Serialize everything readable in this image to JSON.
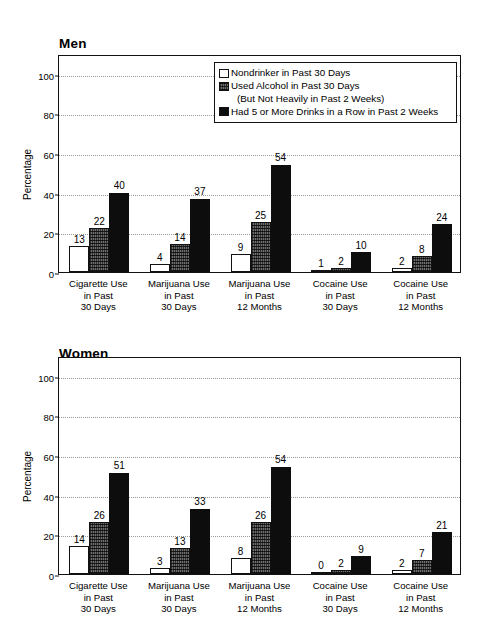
{
  "chart_data": [
    {
      "type": "bar",
      "title": "Men",
      "xlabel": "",
      "ylabel": "Percentage",
      "ylim": [
        0,
        110
      ],
      "yticks": [
        0,
        20,
        40,
        60,
        80,
        100
      ],
      "grid": true,
      "legend_position": "top-right",
      "categories": [
        "Cigarette Use\nin Past\n30 Days",
        "Marijuana Use\nin Past\n30 Days",
        "Marijuana Use\nin Past\n12 Months",
        "Cocaine Use\nin Past\n30 Days",
        "Cocaine Use\nin Past\n12 Months"
      ],
      "series": [
        {
          "name": "Nondrinker in Past 30 Days",
          "values": [
            13,
            4,
            9,
            1,
            2
          ]
        },
        {
          "name": "Used Alcohol in Past 30 Days (But Not Heavily in Past 2 Weeks)",
          "values": [
            22,
            14,
            25,
            2,
            8
          ]
        },
        {
          "name": "Had 5 or More Drinks in a Row in Past 2 Weeks",
          "values": [
            40,
            37,
            54,
            10,
            24
          ]
        }
      ]
    },
    {
      "type": "bar",
      "title": "Women",
      "xlabel": "",
      "ylabel": "Percentage",
      "ylim": [
        0,
        110
      ],
      "yticks": [
        0,
        20,
        40,
        60,
        80,
        100
      ],
      "grid": true,
      "legend_position": "none",
      "categories": [
        "Cigarette Use\nin Past\n30 Days",
        "Marijuana Use\nin Past\n30 Days",
        "Marijuana Use\nin Past\n12 Months",
        "Cocaine Use\nin Past\n30 Days",
        "Cocaine Use\nin Past\n12 Months"
      ],
      "series": [
        {
          "name": "Nondrinker in Past 30 Days",
          "values": [
            14,
            3,
            8,
            0,
            2
          ]
        },
        {
          "name": "Used Alcohol in Past 30 Days (But Not Heavily in Past 2 Weeks)",
          "values": [
            26,
            13,
            26,
            2,
            7
          ]
        },
        {
          "name": "Had 5 or More Drinks in a Row in Past 2 Weeks",
          "values": [
            51,
            33,
            54,
            9,
            21
          ]
        }
      ]
    }
  ],
  "panels": {
    "men": {
      "title": "Men",
      "ylabel": "Percentage",
      "yticks": [
        "100",
        "80",
        "60",
        "40",
        "20",
        "0"
      ],
      "categories": [
        {
          "line1": "Cigarette Use",
          "line2": "in Past",
          "line3": "30 Days"
        },
        {
          "line1": "Marijuana Use",
          "line2": "in Past",
          "line3": "30 Days"
        },
        {
          "line1": "Marijuana Use",
          "line2": "in Past",
          "line3": "12 Months"
        },
        {
          "line1": "Cocaine Use",
          "line2": "in Past",
          "line3": "30 Days"
        },
        {
          "line1": "Cocaine Use",
          "line2": "in Past",
          "line3": "12 Months"
        }
      ],
      "values": {
        "g0": {
          "s0": "13",
          "s1": "22",
          "s2": "40"
        },
        "g1": {
          "s0": "4",
          "s1": "14",
          "s2": "37"
        },
        "g2": {
          "s0": "9",
          "s1": "25",
          "s2": "54"
        },
        "g3": {
          "s0": "1",
          "s1": "2",
          "s2": "10"
        },
        "g4": {
          "s0": "2",
          "s1": "8",
          "s2": "24"
        }
      }
    },
    "women": {
      "title": "Women",
      "ylabel": "Percentage",
      "yticks": [
        "100",
        "80",
        "60",
        "40",
        "20",
        "0"
      ],
      "categories": [
        {
          "line1": "Cigarette Use",
          "line2": "in Past",
          "line3": "30 Days"
        },
        {
          "line1": "Marijuana Use",
          "line2": "in Past",
          "line3": "30 Days"
        },
        {
          "line1": "Marijuana Use",
          "line2": "in Past",
          "line3": "12 Months"
        },
        {
          "line1": "Cocaine Use",
          "line2": "in Past",
          "line3": "30 Days"
        },
        {
          "line1": "Cocaine Use",
          "line2": "in Past",
          "line3": "12 Months"
        }
      ],
      "values": {
        "g0": {
          "s0": "14",
          "s1": "26",
          "s2": "51"
        },
        "g1": {
          "s0": "3",
          "s1": "13",
          "s2": "33"
        },
        "g2": {
          "s0": "8",
          "s1": "26",
          "s2": "54"
        },
        "g3": {
          "s0": "0",
          "s1": "2",
          "s2": "9"
        },
        "g4": {
          "s0": "2",
          "s1": "7",
          "s2": "21"
        }
      }
    }
  },
  "legend": {
    "item0": "Nondrinker in Past 30 Days",
    "item1": "Used Alcohol in Past 30 Days",
    "item1b": "(But Not Heavily in Past 2 Weeks)",
    "item2": "Had 5 or More Drinks in a Row in Past 2 Weeks"
  },
  "colors": {
    "series0": "#ffffff",
    "series1": "#6e6e6e",
    "series2": "#0d0d0d",
    "axis": "#111111",
    "grid": "#9a9a9a",
    "background": "#ffffff"
  }
}
